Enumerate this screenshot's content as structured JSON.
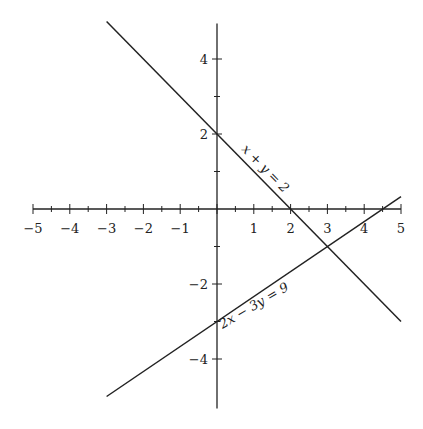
{
  "chart_data": {
    "type": "line",
    "title": "",
    "xlabel": "",
    "ylabel": "",
    "xlim": [
      -5,
      5
    ],
    "ylim": [
      -5,
      5
    ],
    "grid": false,
    "x_ticks": [
      -5,
      -4,
      -3,
      -2,
      -1,
      1,
      2,
      3,
      4,
      5
    ],
    "x_tick_labels": [
      "−5",
      "−4",
      "−3",
      "−2",
      "−1",
      "1",
      "2",
      "3",
      "4",
      "5"
    ],
    "y_ticks": [
      4,
      2,
      -2,
      -4
    ],
    "y_tick_labels": [
      "4",
      "2",
      "−2",
      "−4"
    ],
    "series": [
      {
        "name": "x + y = 2",
        "label": "x + y = 2",
        "x": [
          -3,
          5
        ],
        "y": [
          5,
          -3
        ]
      },
      {
        "name": "2x − 3y = 9",
        "label": "2x − 3y = 9",
        "x": [
          -3,
          5
        ],
        "y": [
          -5,
          0.333
        ]
      }
    ],
    "annotations": [
      {
        "text": "x + y = 2",
        "near": [
          2.3,
          1.4
        ]
      },
      {
        "text": "2x − 3y = 9",
        "near": [
          1.8,
          -2.4
        ]
      }
    ],
    "intersection": [
      3,
      -1
    ]
  },
  "colors": {
    "axis": "#222222",
    "line": "#222222",
    "background": "#ffffff"
  }
}
